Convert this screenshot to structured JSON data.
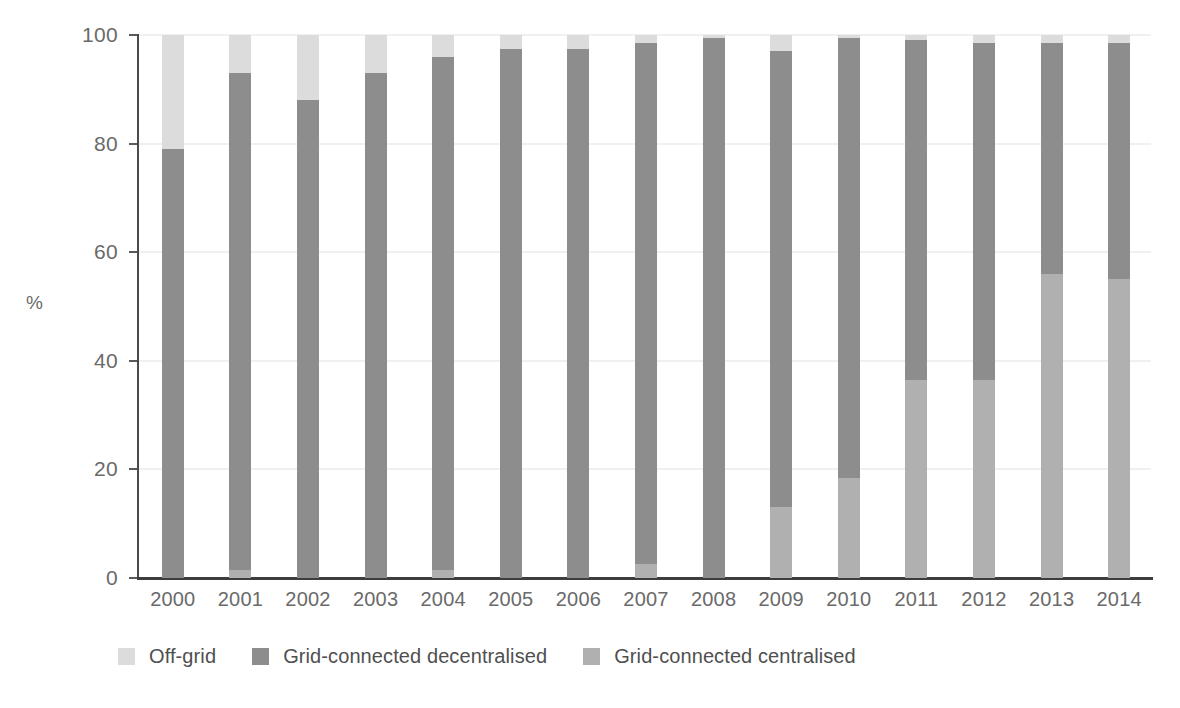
{
  "chart_data": {
    "type": "bar",
    "subtype": "stacked-bar-100-percent",
    "title": "",
    "subtitle": "",
    "xlabel": "",
    "ylabel": "%",
    "ylim": [
      0,
      100
    ],
    "yticks": [
      0,
      20,
      40,
      60,
      80,
      100
    ],
    "ytick_labels": [
      "0",
      "20",
      "40",
      "60",
      "80",
      "100"
    ],
    "grid": true,
    "grid_axis": "y",
    "legend_position": "bottom-left",
    "categories": [
      "2000",
      "2001",
      "2002",
      "2003",
      "2004",
      "2005",
      "2006",
      "2007",
      "2008",
      "2009",
      "2010",
      "2011",
      "2012",
      "2013",
      "2014"
    ],
    "series": [
      {
        "name": "Grid-connected centralised",
        "color": "#b0b0b0",
        "values": [
          0,
          1.5,
          0,
          0,
          1.5,
          0,
          0,
          2.5,
          0,
          13,
          18.5,
          36.5,
          36.5,
          56,
          55
        ]
      },
      {
        "name": "Grid-connected decentralised",
        "color": "#8d8d8d",
        "values": [
          79,
          91.5,
          88,
          93,
          94.5,
          97.5,
          97.5,
          96,
          99.5,
          84,
          81,
          62.5,
          62,
          42.5,
          43.5
        ]
      },
      {
        "name": "Off-grid",
        "color": "#dcdcdc",
        "values": [
          21,
          7,
          12,
          7,
          4,
          2.5,
          2.5,
          1.5,
          0.5,
          3,
          0.5,
          1,
          1.5,
          1.5,
          1.5
        ]
      }
    ],
    "stack_order_bottom_to_top": [
      "Grid-connected centralised",
      "Grid-connected decentralised",
      "Off-grid"
    ],
    "cumulative_tops": {
      "2000": {
        "centralised": 0,
        "decentralised": 79,
        "offgrid": 100
      },
      "2001": {
        "centralised": 1.5,
        "decentralised": 93,
        "offgrid": 100
      },
      "2002": {
        "centralised": 0,
        "decentralised": 88,
        "offgrid": 100
      },
      "2003": {
        "centralised": 0,
        "decentralised": 93,
        "offgrid": 100
      },
      "2004": {
        "centralised": 1.5,
        "decentralised": 96,
        "offgrid": 100
      },
      "2005": {
        "centralised": 0,
        "decentralised": 97.5,
        "offgrid": 100
      },
      "2006": {
        "centralised": 0,
        "decentralised": 97.5,
        "offgrid": 100
      },
      "2007": {
        "centralised": 2.5,
        "decentralised": 98.5,
        "offgrid": 100
      },
      "2008": {
        "centralised": 0,
        "decentralised": 99.5,
        "offgrid": 100
      },
      "2009": {
        "centralised": 13,
        "decentralised": 97,
        "offgrid": 100
      },
      "2010": {
        "centralised": 18.5,
        "decentralised": 99.5,
        "offgrid": 100
      },
      "2011": {
        "centralised": 36.5,
        "decentralised": 99,
        "offgrid": 100
      },
      "2012": {
        "centralised": 36.5,
        "decentralised": 98.5,
        "offgrid": 100
      },
      "2013": {
        "centralised": 56,
        "decentralised": 98.5,
        "offgrid": 100
      },
      "2014": {
        "centralised": 55,
        "decentralised": 98.5,
        "offgrid": 100
      }
    }
  },
  "axes": {
    "y_title": "%",
    "y_ticks": [
      "100",
      "80",
      "60",
      "40",
      "20",
      "0"
    ],
    "x_ticks": [
      "2000",
      "2001",
      "2002",
      "2003",
      "2004",
      "2005",
      "2006",
      "2007",
      "2008",
      "2009",
      "2010",
      "2011",
      "2012",
      "2013",
      "2014"
    ]
  },
  "legend": {
    "items": [
      {
        "label": "Off-grid",
        "color": "#dcdcdc"
      },
      {
        "label": "Grid-connected decentralised",
        "color": "#8d8d8d"
      },
      {
        "label": "Grid-connected centralised",
        "color": "#b0b0b0"
      }
    ]
  },
  "colors": {
    "offgrid": "#dcdcdc",
    "decentralised": "#8d8d8d",
    "centralised": "#b0b0b0",
    "axis": "#4a4a4a",
    "grid": "#e2e2e2",
    "text": "#6a6a6a",
    "background": "#ffffff"
  }
}
